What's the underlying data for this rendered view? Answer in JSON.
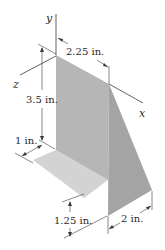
{
  "figure": {
    "axes": {
      "x": "x",
      "y": "y",
      "z": "z"
    },
    "dimensions": {
      "top_width": "2.25 in.",
      "height": "3.5 in.",
      "base_depth": "1 in.",
      "lower_height": "1.25 in.",
      "fin_depth": "2 in."
    },
    "colors": {
      "back_plate": "#b4b4b4",
      "fin": "#a6a6a6",
      "floor_plate": "#d2d2d2",
      "lines": "#3a3a3a"
    }
  }
}
